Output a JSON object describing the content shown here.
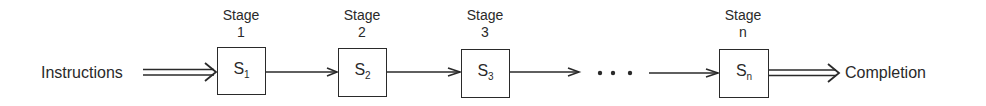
{
  "diagram": {
    "type": "pipeline",
    "input_label": "Instructions",
    "output_label": "Completion",
    "ellipsis": "• • •",
    "stages": [
      {
        "title": "Stage",
        "index": "1",
        "symbol": "S",
        "subscript": "1"
      },
      {
        "title": "Stage",
        "index": "2",
        "symbol": "S",
        "subscript": "2"
      },
      {
        "title": "Stage",
        "index": "3",
        "symbol": "S",
        "subscript": "3"
      },
      {
        "title": "Stage",
        "index": "n",
        "symbol": "S",
        "subscript": "n"
      }
    ],
    "colors": {
      "line": "#2a2a2a",
      "background": "#ffffff"
    }
  }
}
